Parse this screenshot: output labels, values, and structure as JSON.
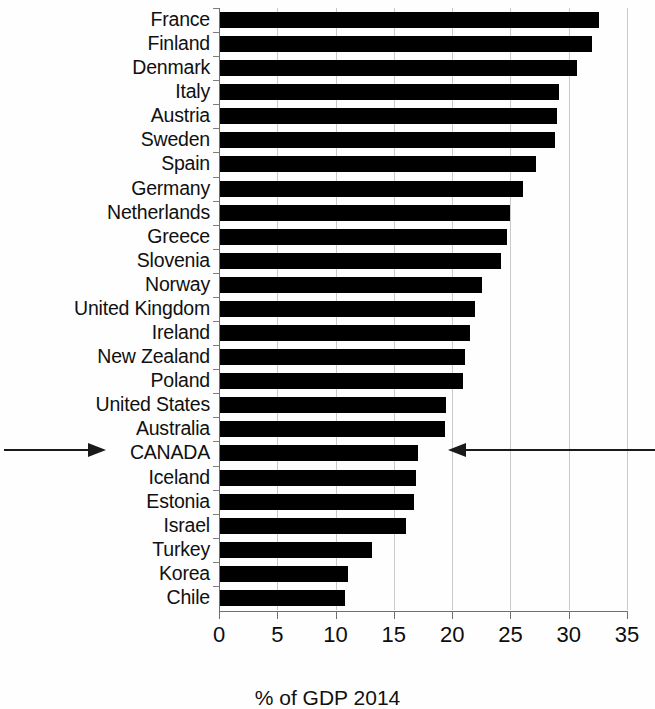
{
  "chart_data": {
    "type": "bar",
    "orientation": "horizontal",
    "title": "",
    "subtitle": "",
    "caption": "% of GDP 2014",
    "xlabel": "",
    "ylabel": "",
    "xlim": [
      0,
      35
    ],
    "xticks": [
      0,
      5,
      10,
      15,
      20,
      25,
      30,
      35
    ],
    "xtick_labels": [
      "0",
      "5",
      "10",
      "15",
      "20",
      "25",
      "30",
      "35"
    ],
    "grid": "vertical",
    "legend": "none",
    "bar_color": "#000000",
    "categories": [
      "France",
      "Finland",
      "Denmark",
      "Italy",
      "Austria",
      "Sweden",
      "Spain",
      "Germany",
      "Netherlands",
      "Greece",
      "Slovenia",
      "Norway",
      "United Kingdom",
      "Ireland",
      "New Zealand",
      "Poland",
      "United States",
      "Australia",
      "CANADA",
      "Iceland",
      "Estonia",
      "Israel",
      "Turkey",
      "Korea",
      "Chile"
    ],
    "values": [
      32.6,
      32.0,
      30.7,
      29.2,
      29.0,
      28.8,
      27.2,
      26.1,
      25.0,
      24.7,
      24.2,
      22.6,
      22.0,
      21.5,
      21.1,
      20.9,
      19.5,
      19.4,
      17.1,
      16.9,
      16.7,
      16.0,
      13.1,
      11.1,
      10.8
    ],
    "highlighted_category": "CANADA",
    "annotations": [
      {
        "name": "left-arrow",
        "direction": "right",
        "target": "CANADA"
      },
      {
        "name": "right-arrow",
        "direction": "left",
        "target": "CANADA"
      }
    ]
  }
}
